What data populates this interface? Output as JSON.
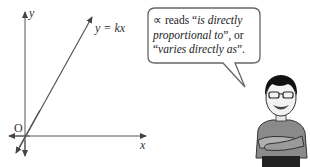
{
  "graph": {
    "y_axis_label": "y",
    "x_axis_label": "x",
    "origin_label": "O",
    "line_label": "y = kx"
  },
  "speech_bubble": {
    "symbol": "∝",
    "line1_pre": " reads “",
    "line1_italic": "is directly",
    "line2_italic": "proportional to",
    "line2_post": "”, or",
    "line3_pre": "“",
    "line3_italic": "varies directly as",
    "line3_post": "”."
  },
  "character": {
    "description": "cartoon boy with glasses, arms crossed"
  }
}
